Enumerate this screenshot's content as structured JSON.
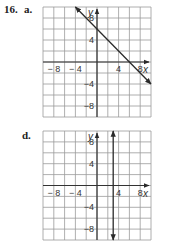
{
  "problem": {
    "number": "16.",
    "part_a": "a.",
    "part_d": "d."
  },
  "chart_data": [
    {
      "id": "a",
      "type": "line",
      "title": "16. a.",
      "xlabel": "x",
      "ylabel": "y",
      "xlim": [
        -10,
        10
      ],
      "ylim": [
        -10,
        10
      ],
      "grid": true,
      "grid_step": 2,
      "x_ticks": [
        "-8",
        "-4",
        "4",
        "8"
      ],
      "y_ticks": [
        "8",
        "4",
        "-4",
        "-8"
      ],
      "series": [
        {
          "name": "y = -x + 6",
          "x": [
            -4,
            10
          ],
          "y": [
            10,
            -4
          ],
          "arrows": "both"
        }
      ]
    },
    {
      "id": "d",
      "type": "line",
      "title": "d.",
      "xlabel": "x",
      "ylabel": "y",
      "xlim": [
        -10,
        10
      ],
      "ylim": [
        -10,
        10
      ],
      "grid": true,
      "grid_step": 2,
      "x_ticks": [
        "-8",
        "-4",
        "4",
        "8"
      ],
      "y_ticks": [
        "8",
        "4",
        "-4",
        "-8"
      ],
      "series": [
        {
          "name": "x = 3",
          "x": [
            3,
            3
          ],
          "y": [
            10,
            -10
          ],
          "arrows": "both"
        }
      ]
    }
  ],
  "colors": {
    "grid": "#9a9a9a",
    "axis": "#333333",
    "line": "#2a2a2a"
  }
}
